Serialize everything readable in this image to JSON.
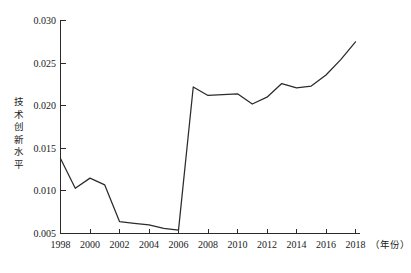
{
  "chart_data": {
    "type": "line",
    "title": "",
    "subtitle": "",
    "xlabel": "（年份）",
    "ylabel": "技术创新水平",
    "ylabel_chars": [
      "技",
      "术",
      "创",
      "新",
      "水",
      "平"
    ],
    "x": [
      1998,
      1999,
      2000,
      2001,
      2002,
      2003,
      2004,
      2005,
      2006,
      2007,
      2008,
      2009,
      2010,
      2011,
      2012,
      2013,
      2014,
      2015,
      2016,
      2017,
      2018
    ],
    "values": [
      0.0138,
      0.0103,
      0.0115,
      0.0107,
      0.0064,
      0.0062,
      0.006,
      0.0056,
      0.0054,
      0.0222,
      0.0212,
      0.0213,
      0.0214,
      0.0202,
      0.021,
      0.0226,
      0.0221,
      0.0223,
      0.0236,
      0.0254,
      0.0275
    ],
    "series": [
      {
        "name": "技术创新水平",
        "color": "#2b2b2b",
        "values": [
          0.0138,
          0.0103,
          0.0115,
          0.0107,
          0.0064,
          0.0062,
          0.006,
          0.0056,
          0.0054,
          0.0222,
          0.0212,
          0.0213,
          0.0214,
          0.0202,
          0.021,
          0.0226,
          0.0221,
          0.0223,
          0.0236,
          0.0254,
          0.0275
        ]
      }
    ],
    "xlim": [
      1998,
      2018
    ],
    "ylim": [
      0.005,
      0.03
    ],
    "xticks": [
      1998,
      2000,
      2002,
      2004,
      2006,
      2008,
      2010,
      2012,
      2014,
      2016,
      2018
    ],
    "xtick_labels": [
      "1998",
      "2000",
      "2002",
      "2004",
      "2006",
      "2008",
      "2010",
      "2012",
      "2014",
      "2016",
      "2018"
    ],
    "yticks": [
      0.005,
      0.01,
      0.015,
      0.02,
      0.025,
      0.03
    ],
    "ytick_labels": [
      "0.005",
      "0.010",
      "0.015",
      "0.020",
      "0.025",
      "0.030"
    ],
    "grid": false,
    "legend": false,
    "legend_position": "none",
    "line_color": "#2b2b2b",
    "background_color": "#ffffff",
    "axis_color": "#2a2a2a"
  }
}
